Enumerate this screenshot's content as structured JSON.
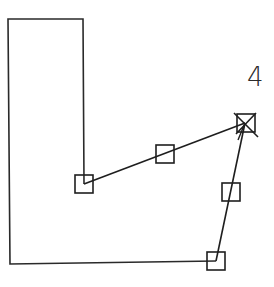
{
  "diagram": {
    "type": "polygon-editing-sketch",
    "stroke_color": "#2a2a2a",
    "background": "#ffffff",
    "label": "4",
    "outline_path": [
      [
        84,
        184
      ],
      [
        83,
        19
      ],
      [
        8,
        19
      ],
      [
        10,
        264
      ],
      [
        216,
        261
      ]
    ],
    "edges": [
      {
        "from": "node_a",
        "to": "node_b"
      },
      {
        "from": "node_b",
        "to": "node_c"
      }
    ],
    "nodes": [
      {
        "id": "node_a",
        "kind": "vertex-handle",
        "x": 84,
        "y": 184
      },
      {
        "id": "node_b",
        "kind": "selected-vertex-handle",
        "x": 245,
        "y": 123
      },
      {
        "id": "node_c",
        "kind": "vertex-handle",
        "x": 216,
        "y": 261
      }
    ],
    "midpoint_handles": [
      {
        "id": "mid_ab",
        "x": 165,
        "y": 154
      },
      {
        "id": "mid_bc",
        "x": 231,
        "y": 192
      }
    ],
    "label_position": {
      "x": 250,
      "y": 88
    }
  }
}
